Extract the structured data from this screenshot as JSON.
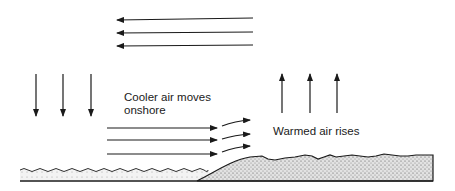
{
  "diagram": {
    "labels": {
      "cooler_line1": "Cooler air moves",
      "cooler_line2": "onshore",
      "warmed": "Warmed air rises"
    },
    "colors": {
      "stroke": "#1a1a1a",
      "land_fill": "#cfcfcf",
      "water_fill": "#e6e6e6"
    },
    "arrows": {
      "upper_return_flow": {
        "direction": "left",
        "count": 3,
        "y": [
          20,
          33,
          46
        ],
        "x_from": 253,
        "x_to": 117
      },
      "sinking_air": {
        "direction": "down",
        "count": 3,
        "x": [
          36,
          63,
          91
        ],
        "y_from": 74,
        "y_to": 116
      },
      "onshore_flow": {
        "direction": "right",
        "count": 3,
        "y": [
          128,
          140,
          154
        ],
        "x_from": 107,
        "x_to": 217
      },
      "rising_curve": {
        "direction": "up-right",
        "count": 3
      },
      "rising_air": {
        "direction": "up",
        "count": 3,
        "x": [
          282,
          310,
          337
        ],
        "y_from": 113,
        "y_to": 74
      }
    },
    "regions": [
      "sea",
      "land"
    ]
  }
}
